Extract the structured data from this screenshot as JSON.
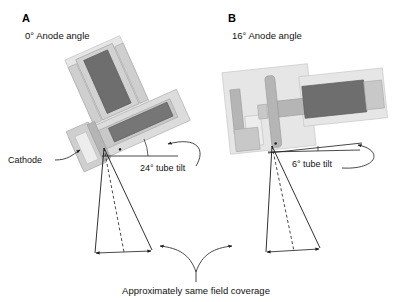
{
  "figure": {
    "background_color": "#ffffff",
    "line_color": "#1a1a1a",
    "anode_color": "#6e6e6e",
    "housing_color": "#dcdcdc",
    "caption": "Approximately same field coverage"
  },
  "panels": [
    {
      "letter": "A",
      "title": "0° Anode angle",
      "anode_angle_deg": 0,
      "tube_tilt_label": "24° tube tilt",
      "tube_tilt_deg": 24,
      "cathode_label": "Cathode"
    },
    {
      "letter": "B",
      "title": "16° Anode angle",
      "anode_angle_deg": 16,
      "tube_tilt_label": "6° tube tilt",
      "tube_tilt_deg": 6,
      "cathode_label": ""
    }
  ]
}
